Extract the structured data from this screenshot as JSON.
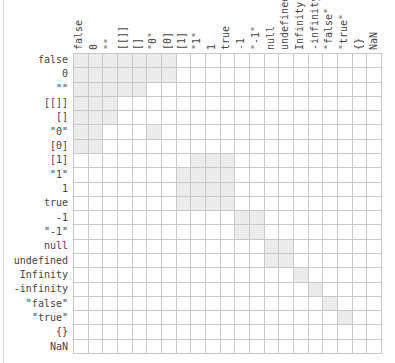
{
  "chart_data": {
    "type": "heatmap",
    "title": "",
    "xlabel": "",
    "ylabel": "",
    "categories": [
      "false",
      "0",
      "\"\"",
      "[[]]",
      "[]",
      "\"0\"",
      "[0]",
      "[1]",
      "\"1\"",
      "1",
      "true",
      "-1",
      "\"-1\"",
      "null",
      "undefined",
      "Infinity",
      "-infinity",
      "\"false\"",
      "\"true\"",
      "{}",
      "NaN"
    ],
    "row_labels": [
      "false",
      "0",
      "\"\"",
      "[[]]",
      "[]",
      "\"0\"",
      "[0]",
      "[1]",
      "\"1\"",
      "1",
      "true",
      "-1",
      "\"-1\"",
      "null",
      "undefined",
      "Infinity",
      "-infinity",
      "\"false\"",
      "\"true\"",
      "{}",
      "NaN"
    ],
    "col_labels": [
      "false",
      "0",
      "\"\"",
      "[[]]",
      "[]",
      "\"0\"",
      "[0]",
      "[1]",
      "\"1\"",
      "1",
      "true",
      "-1",
      "\"-1\"",
      "null",
      "undefined",
      "Infinity",
      "-infinity",
      "\"false\"",
      "\"true\"",
      "{}",
      "NaN"
    ],
    "values": [
      [
        1,
        1,
        1,
        1,
        1,
        1,
        1,
        0,
        0,
        0,
        0,
        0,
        0,
        0,
        0,
        0,
        0,
        0,
        0,
        0,
        0
      ],
      [
        1,
        1,
        1,
        1,
        1,
        1,
        1,
        0,
        0,
        0,
        0,
        0,
        0,
        0,
        0,
        0,
        0,
        0,
        0,
        0,
        0
      ],
      [
        1,
        1,
        1,
        1,
        1,
        0,
        0,
        0,
        0,
        0,
        0,
        0,
        0,
        0,
        0,
        0,
        0,
        0,
        0,
        0,
        0
      ],
      [
        1,
        1,
        1,
        0,
        0,
        0,
        0,
        0,
        0,
        0,
        0,
        0,
        0,
        0,
        0,
        0,
        0,
        0,
        0,
        0,
        0
      ],
      [
        1,
        1,
        1,
        0,
        0,
        0,
        0,
        0,
        0,
        0,
        0,
        0,
        0,
        0,
        0,
        0,
        0,
        0,
        0,
        0,
        0
      ],
      [
        1,
        1,
        0,
        0,
        0,
        1,
        0,
        0,
        0,
        0,
        0,
        0,
        0,
        0,
        0,
        0,
        0,
        0,
        0,
        0,
        0
      ],
      [
        1,
        1,
        0,
        0,
        0,
        0,
        0,
        0,
        0,
        0,
        0,
        0,
        0,
        0,
        0,
        0,
        0,
        0,
        0,
        0,
        0
      ],
      [
        0,
        0,
        0,
        0,
        0,
        0,
        0,
        0,
        1,
        1,
        1,
        0,
        0,
        0,
        0,
        0,
        0,
        0,
        0,
        0,
        0
      ],
      [
        0,
        0,
        0,
        0,
        0,
        0,
        0,
        1,
        1,
        1,
        1,
        0,
        0,
        0,
        0,
        0,
        0,
        0,
        0,
        0,
        0
      ],
      [
        0,
        0,
        0,
        0,
        0,
        0,
        0,
        1,
        1,
        1,
        1,
        0,
        0,
        0,
        0,
        0,
        0,
        0,
        0,
        0,
        0
      ],
      [
        0,
        0,
        0,
        0,
        0,
        0,
        0,
        1,
        1,
        1,
        1,
        0,
        0,
        0,
        0,
        0,
        0,
        0,
        0,
        0,
        0
      ],
      [
        0,
        0,
        0,
        0,
        0,
        0,
        0,
        0,
        0,
        0,
        0,
        1,
        1,
        0,
        0,
        0,
        0,
        0,
        0,
        0,
        0
      ],
      [
        0,
        0,
        0,
        0,
        0,
        0,
        0,
        0,
        0,
        0,
        0,
        1,
        1,
        0,
        0,
        0,
        0,
        0,
        0,
        0,
        0
      ],
      [
        0,
        0,
        0,
        0,
        0,
        0,
        0,
        0,
        0,
        0,
        0,
        0,
        0,
        1,
        1,
        0,
        0,
        0,
        0,
        0,
        0
      ],
      [
        0,
        0,
        0,
        0,
        0,
        0,
        0,
        0,
        0,
        0,
        0,
        0,
        0,
        1,
        1,
        0,
        0,
        0,
        0,
        0,
        0
      ],
      [
        0,
        0,
        0,
        0,
        0,
        0,
        0,
        0,
        0,
        0,
        0,
        0,
        0,
        0,
        0,
        1,
        0,
        0,
        0,
        0,
        0
      ],
      [
        0,
        0,
        0,
        0,
        0,
        0,
        0,
        0,
        0,
        0,
        0,
        0,
        0,
        0,
        0,
        0,
        1,
        0,
        0,
        0,
        0
      ],
      [
        0,
        0,
        0,
        0,
        0,
        0,
        0,
        0,
        0,
        0,
        0,
        0,
        0,
        0,
        0,
        0,
        0,
        1,
        0,
        0,
        0
      ],
      [
        0,
        0,
        0,
        0,
        0,
        0,
        0,
        0,
        0,
        0,
        0,
        0,
        0,
        0,
        0,
        0,
        0,
        0,
        1,
        0,
        0
      ],
      [
        0,
        0,
        0,
        0,
        0,
        0,
        0,
        0,
        0,
        0,
        0,
        0,
        0,
        0,
        0,
        0,
        0,
        0,
        0,
        0,
        0
      ],
      [
        0,
        0,
        0,
        0,
        0,
        0,
        0,
        0,
        0,
        0,
        0,
        0,
        0,
        0,
        0,
        0,
        0,
        0,
        0,
        0,
        0
      ]
    ],
    "legend": [],
    "grid": true,
    "colors": {
      "on": "#ebebeb",
      "off": "#ffffff",
      "gridline": "#c9c9c9"
    }
  }
}
